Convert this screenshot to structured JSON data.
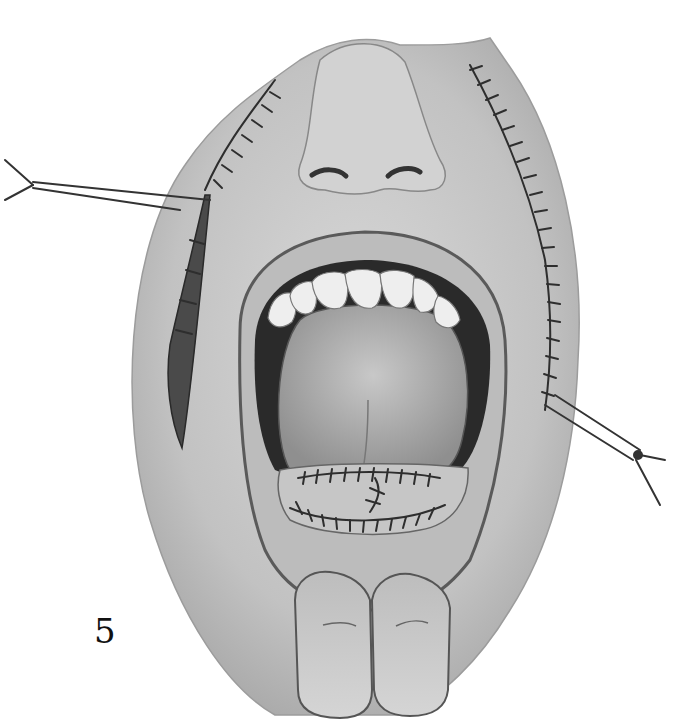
{
  "figure": {
    "label": "5",
    "colors": {
      "skin": "#c9c9c9",
      "skin_dark": "#9a9a9a",
      "outline": "#3a3a3a",
      "mouth_cavity": "#2a2a2a",
      "tongue": "#b5b5b5",
      "teeth": "#eeeeee",
      "suture": "#333333",
      "background": "#ffffff"
    },
    "elements": {
      "left_retractor": "retractor",
      "right_retractor": "retractor",
      "left_incision": "sutured-incision",
      "right_incision": "sutured-incision",
      "lower_lip_repair": "sutured-lip",
      "fingers": "retracting-fingers"
    }
  }
}
